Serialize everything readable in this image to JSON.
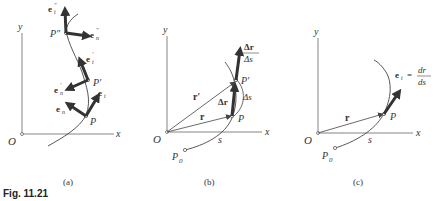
{
  "figure": {
    "caption": "Fig. 11.21",
    "panels": [
      {
        "id": "a",
        "label": "(a)",
        "origin": "O",
        "x_axis": "x",
        "y_axis": "y",
        "points": [
          "P",
          "P′",
          "P″"
        ],
        "vectors": [
          "e_t",
          "e_n",
          "e′_t",
          "e′_n",
          "e″_t",
          "e″_n"
        ]
      },
      {
        "id": "b",
        "label": "(b)",
        "origin": "O",
        "x_axis": "x",
        "y_axis": "y",
        "points": [
          "P₀",
          "P",
          "P′"
        ],
        "vectors": [
          "r",
          "r′",
          "Δr",
          "Δr/Δs"
        ],
        "arc_labels": [
          "s",
          "Δs"
        ]
      },
      {
        "id": "c",
        "label": "(c)",
        "origin": "O",
        "x_axis": "x",
        "y_axis": "y",
        "points": [
          "P₀",
          "P"
        ],
        "vectors": [
          "r",
          "e_t"
        ],
        "arc_labels": [
          "s"
        ],
        "equation": "e_t = dr/ds"
      }
    ]
  },
  "labels": {
    "O": "O",
    "x": "x",
    "y": "y",
    "P": "P",
    "Pp": "P′",
    "Ppp": "P″",
    "P0": "P",
    "zero": "0",
    "e": "e",
    "t": "t",
    "n": "n",
    "prime": "′",
    "dprime": "″",
    "r": "r",
    "rp": "r′",
    "dr": "Δr",
    "ds": "Δs",
    "s": "s",
    "d_r": "dr",
    "d_s": "ds",
    "eq": "=",
    "cap_a": "(a)",
    "cap_b": "(b)",
    "cap_c": "(c)",
    "fig": "Fig. 11.21"
  }
}
